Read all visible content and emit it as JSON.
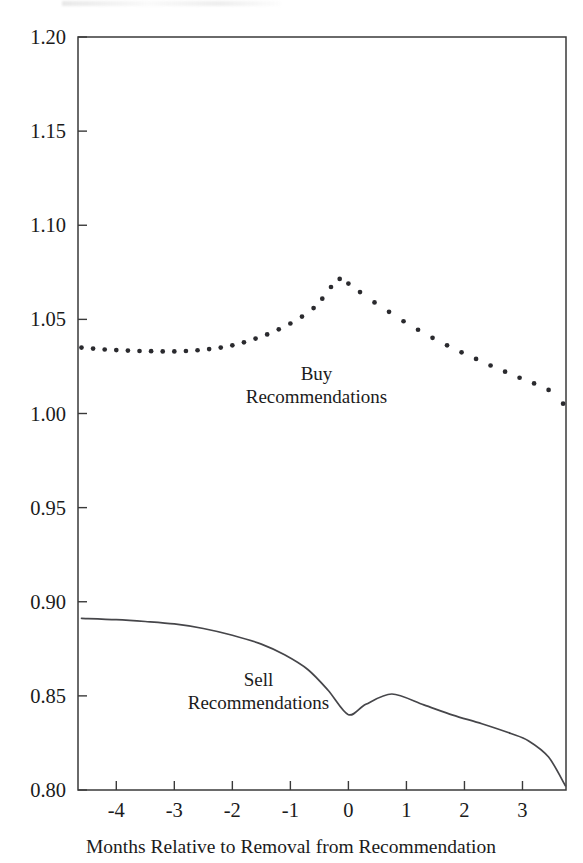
{
  "chart_data": {
    "type": "line",
    "title": "",
    "xlabel": "Months Relative to Removal from Recommendation",
    "ylabel": "",
    "xlim": [
      -4.66,
      3.75
    ],
    "ylim": [
      0.8,
      1.2
    ],
    "grid": false,
    "legend": "inline-annotations",
    "x_ticks": [
      -4,
      -3,
      -2,
      -1,
      0,
      1,
      2,
      3
    ],
    "x_tick_labels": [
      "-4",
      "-3",
      "-2",
      "-1",
      "0",
      "1",
      "2",
      "3"
    ],
    "y_ticks": [
      0.8,
      0.85,
      0.9,
      0.95,
      1.0,
      1.05,
      1.1,
      1.15,
      1.2
    ],
    "y_tick_labels": [
      "0.80",
      "0.85",
      "0.90",
      "0.95",
      "1.00",
      "1.05",
      "1.10",
      "1.15",
      "1.20"
    ],
    "series": [
      {
        "name": "Buy Recommendations",
        "style": "dotted",
        "annotation": [
          "Buy",
          "Recommendations"
        ],
        "annotation_x": -0.55,
        "annotation_y": 1.018,
        "x": [
          -4.6,
          -4.4,
          -4.2,
          -4.0,
          -3.8,
          -3.6,
          -3.4,
          -3.2,
          -3.0,
          -2.8,
          -2.6,
          -2.4,
          -2.2,
          -2.0,
          -1.8,
          -1.6,
          -1.4,
          -1.2,
          -1.0,
          -0.8,
          -0.6,
          -0.45,
          -0.3,
          -0.15,
          0.0,
          0.2,
          0.45,
          0.7,
          0.95,
          1.2,
          1.45,
          1.7,
          1.95,
          2.2,
          2.45,
          2.7,
          2.95,
          3.2,
          3.45,
          3.7
        ],
        "y": [
          1.035,
          1.0345,
          1.034,
          1.0337,
          1.0334,
          1.0332,
          1.0331,
          1.033,
          1.033,
          1.0332,
          1.0336,
          1.0342,
          1.035,
          1.0362,
          1.0378,
          1.0398,
          1.042,
          1.0447,
          1.0478,
          1.0515,
          1.056,
          1.061,
          1.0672,
          1.0715,
          1.069,
          1.0645,
          1.059,
          1.054,
          1.049,
          1.0445,
          1.0402,
          1.0362,
          1.0325,
          1.029,
          1.0255,
          1.0222,
          1.019,
          1.016,
          1.0125,
          1.0052
        ]
      },
      {
        "name": "Sell Recommendations",
        "style": "solid",
        "annotation": [
          "Sell",
          "Recommendations"
        ],
        "annotation_x": -1.55,
        "annotation_y": 0.8555,
        "x": [
          -4.6,
          -4.0,
          -3.5,
          -3.0,
          -2.5,
          -2.0,
          -1.5,
          -1.1,
          -0.7,
          -0.35,
          0.0,
          0.3,
          0.75,
          1.3,
          1.8,
          2.3,
          2.8,
          3.1,
          3.45,
          3.74
        ],
        "y": [
          0.8912,
          0.8905,
          0.8895,
          0.8882,
          0.8858,
          0.8822,
          0.8775,
          0.8718,
          0.864,
          0.853,
          0.84,
          0.8455,
          0.851,
          0.8452,
          0.8398,
          0.8352,
          0.83,
          0.8262,
          0.8175,
          0.8022
        ]
      }
    ]
  }
}
